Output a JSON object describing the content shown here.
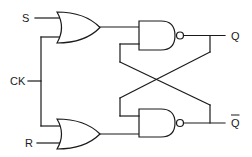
{
  "diagram": {
    "labels": {
      "s": "S",
      "ck": "CK",
      "r": "R",
      "q": "Q",
      "q_bar": "Q"
    },
    "components": [
      {
        "id": "or-top",
        "type": "OR gate",
        "inputs": [
          "S",
          "CK"
        ]
      },
      {
        "id": "or-bottom",
        "type": "OR gate",
        "inputs": [
          "CK",
          "R"
        ]
      },
      {
        "id": "nand-top",
        "type": "NAND gate",
        "output": "Q"
      },
      {
        "id": "nand-bottom",
        "type": "NAND gate",
        "output": "Q-bar"
      }
    ],
    "colors": {
      "stroke": "#1a1a1a",
      "background": "#ffffff"
    }
  }
}
